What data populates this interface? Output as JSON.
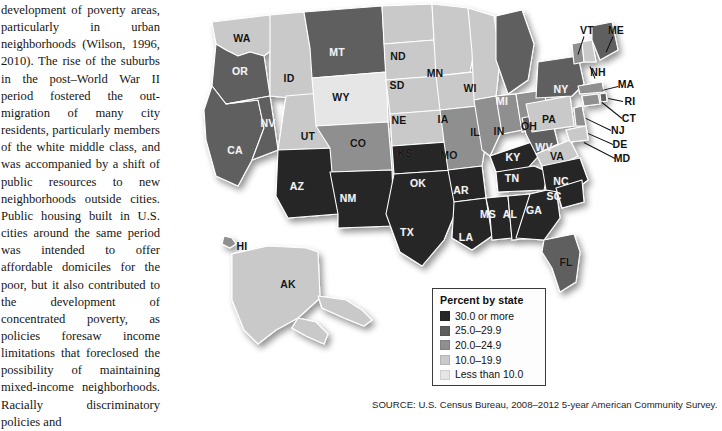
{
  "article": {
    "paragraph": "development of poverty areas, particularly in urban neighborhoods (Wilson, 1996, 2010). The rise of the suburbs in the post–World War II period fostered the out-migration of many city residents, particularly members of the white middle class, and was accompanied by a shift of public resources to new neighborhoods outside cities. Public housing built in U.S. cities around the same period was intended to offer affordable domiciles for the poor, but it also contributed to the development of concentrated poverty, as policies foresaw income limitations that foreclosed the possibility of maintaining mixed-income neighborhoods. Racially discriminatory policies and"
  },
  "figure": {
    "source": "SOURCE: U.S. Census Bureau, 2008–2012 5-year American Community Survey."
  },
  "legend": {
    "title": "Percent by state",
    "items": [
      {
        "label": "30.0 or more",
        "color": "#262626"
      },
      {
        "label": "25.0–29.9",
        "color": "#5e5e5e"
      },
      {
        "label": "20.0–24.9",
        "color": "#8f8f8f"
      },
      {
        "label": "10.0–19.9",
        "color": "#c9c9c9"
      },
      {
        "label": "Less than 10.0",
        "color": "#e6e6e6"
      }
    ]
  },
  "chart_data": {
    "type": "map",
    "title": "Percent by state",
    "subtitle": "",
    "xlabel": "",
    "ylabel": "",
    "map_type": "choropleth-us-states",
    "units": "percent",
    "bins": [
      {
        "label": "30.0 or more",
        "min": 30.0,
        "max": null,
        "color": "#262626"
      },
      {
        "label": "25.0–29.9",
        "min": 25.0,
        "max": 29.9,
        "color": "#5e5e5e"
      },
      {
        "label": "20.0–24.9",
        "min": 20.0,
        "max": 24.9,
        "color": "#8f8f8f"
      },
      {
        "label": "10.0–19.9",
        "min": 10.0,
        "max": 19.9,
        "color": "#c9c9c9"
      },
      {
        "label": "Less than 10.0",
        "min": null,
        "max": 10.0,
        "color": "#e6e6e6"
      }
    ],
    "legend_position": "bottom-left",
    "grid": false,
    "states": [
      {
        "code": "WA",
        "bin": "10.0–19.9",
        "color": "#c9c9c9",
        "x": 56,
        "y": 38,
        "tone": "light"
      },
      {
        "code": "OR",
        "bin": "25.0–29.9",
        "color": "#5e5e5e",
        "x": 54,
        "y": 71,
        "tone": "dark"
      },
      {
        "code": "CA",
        "bin": "25.0–29.9",
        "color": "#5e5e5e",
        "x": 49,
        "y": 150,
        "tone": "dark"
      },
      {
        "code": "ID",
        "bin": "10.0–19.9",
        "color": "#c9c9c9",
        "x": 103,
        "y": 78,
        "tone": "light"
      },
      {
        "code": "NV",
        "bin": "25.0–29.9",
        "color": "#5e5e5e",
        "x": 82,
        "y": 123,
        "tone": "dark"
      },
      {
        "code": "UT",
        "bin": "10.0–19.9",
        "color": "#c9c9c9",
        "x": 122,
        "y": 136,
        "tone": "light"
      },
      {
        "code": "AZ",
        "bin": "30.0 or more",
        "color": "#262626",
        "x": 111,
        "y": 186,
        "tone": "dark"
      },
      {
        "code": "MT",
        "bin": "25.0–29.9",
        "color": "#5e5e5e",
        "x": 151,
        "y": 52,
        "tone": "dark"
      },
      {
        "code": "WY",
        "bin": "Less than 10.0",
        "color": "#e6e6e6",
        "x": 155,
        "y": 97,
        "tone": "light"
      },
      {
        "code": "CO",
        "bin": "20.0–24.9",
        "color": "#8f8f8f",
        "x": 172,
        "y": 143,
        "tone": "light"
      },
      {
        "code": "NM",
        "bin": "30.0 or more",
        "color": "#262626",
        "x": 162,
        "y": 198,
        "tone": "dark"
      },
      {
        "code": "ND",
        "bin": "10.0–19.9",
        "color": "#c9c9c9",
        "x": 212,
        "y": 56,
        "tone": "light"
      },
      {
        "code": "SD",
        "bin": "10.0–19.9",
        "color": "#c9c9c9",
        "x": 211,
        "y": 85,
        "tone": "light"
      },
      {
        "code": "NE",
        "bin": "10.0–19.9",
        "color": "#c9c9c9",
        "x": 213,
        "y": 120,
        "tone": "light"
      },
      {
        "code": "KS",
        "bin": "10.0–19.9",
        "color": "#c9c9c9",
        "x": 219,
        "y": 153,
        "tone": "light"
      },
      {
        "code": "OK",
        "bin": "30.0 or more",
        "color": "#262626",
        "x": 232,
        "y": 183,
        "tone": "dark"
      },
      {
        "code": "TX",
        "bin": "30.0 or more",
        "color": "#262626",
        "x": 221,
        "y": 232,
        "tone": "dark"
      },
      {
        "code": "MN",
        "bin": "10.0–19.9",
        "color": "#c9c9c9",
        "x": 249,
        "y": 73,
        "tone": "light"
      },
      {
        "code": "IA",
        "bin": "10.0–19.9",
        "color": "#c9c9c9",
        "x": 257,
        "y": 119,
        "tone": "light"
      },
      {
        "code": "MO",
        "bin": "20.0–24.9",
        "color": "#8f8f8f",
        "x": 263,
        "y": 155,
        "tone": "light"
      },
      {
        "code": "AR",
        "bin": "30.0 or more",
        "color": "#262626",
        "x": 275,
        "y": 190,
        "tone": "dark"
      },
      {
        "code": "LA",
        "bin": "30.0 or more",
        "color": "#262626",
        "x": 280,
        "y": 237,
        "tone": "dark"
      },
      {
        "code": "WI",
        "bin": "10.0–19.9",
        "color": "#c9c9c9",
        "x": 284,
        "y": 88,
        "tone": "light"
      },
      {
        "code": "IL",
        "bin": "20.0–24.9",
        "color": "#8f8f8f",
        "x": 289,
        "y": 132,
        "tone": "light"
      },
      {
        "code": "MS",
        "bin": "30.0 or more",
        "color": "#262626",
        "x": 302,
        "y": 214,
        "tone": "dark"
      },
      {
        "code": "MI",
        "bin": "25.0–29.9",
        "color": "#5e5e5e",
        "x": 316,
        "y": 101,
        "tone": "dark"
      },
      {
        "code": "IN",
        "bin": "20.0–24.9",
        "color": "#8f8f8f",
        "x": 313,
        "y": 131,
        "tone": "light"
      },
      {
        "code": "KY",
        "bin": "30.0 or more",
        "color": "#262626",
        "x": 327,
        "y": 157,
        "tone": "dark"
      },
      {
        "code": "TN",
        "bin": "30.0 or more",
        "color": "#262626",
        "x": 326,
        "y": 178,
        "tone": "dark"
      },
      {
        "code": "AL",
        "bin": "30.0 or more",
        "color": "#262626",
        "x": 324,
        "y": 214,
        "tone": "dark"
      },
      {
        "code": "OH",
        "bin": "20.0–24.9",
        "color": "#8f8f8f",
        "x": 343,
        "y": 126,
        "tone": "light"
      },
      {
        "code": "GA",
        "bin": "30.0 or more",
        "color": "#262626",
        "x": 348,
        "y": 210,
        "tone": "dark"
      },
      {
        "code": "FL",
        "bin": "25.0–29.9",
        "color": "#5e5e5e",
        "x": 380,
        "y": 262,
        "tone": "light"
      },
      {
        "code": "WV",
        "bin": "25.0–29.9",
        "color": "#5e5e5e",
        "x": 358,
        "y": 147,
        "tone": "dark"
      },
      {
        "code": "VA",
        "bin": "10.0–19.9",
        "color": "#c9c9c9",
        "x": 371,
        "y": 156,
        "tone": "light"
      },
      {
        "code": "NC",
        "bin": "30.0 or more",
        "color": "#262626",
        "x": 375,
        "y": 181,
        "tone": "dark"
      },
      {
        "code": "SC",
        "bin": "30.0 or more",
        "color": "#262626",
        "x": 368,
        "y": 196,
        "tone": "dark"
      },
      {
        "code": "PA",
        "bin": "10.0–19.9",
        "color": "#c9c9c9",
        "x": 363,
        "y": 119,
        "tone": "light"
      },
      {
        "code": "NY",
        "bin": "25.0–29.9",
        "color": "#5e5e5e",
        "x": 375,
        "y": 89,
        "tone": "dark"
      },
      {
        "code": "VT",
        "bin": "20.0–24.9",
        "color": "#8f8f8f",
        "x": 401,
        "y": 30,
        "tone": "out"
      },
      {
        "code": "NH",
        "bin": "10.0–19.9",
        "color": "#c9c9c9",
        "x": 412,
        "y": 72,
        "tone": "out"
      },
      {
        "code": "ME",
        "bin": "25.0–29.9",
        "color": "#5e5e5e",
        "x": 430,
        "y": 30,
        "tone": "out"
      },
      {
        "code": "MA",
        "bin": "20.0–24.9",
        "color": "#8f8f8f",
        "x": 440,
        "y": 84,
        "tone": "out"
      },
      {
        "code": "RI",
        "bin": "25.0–29.9",
        "color": "#5e5e5e",
        "x": 444,
        "y": 101,
        "tone": "out"
      },
      {
        "code": "CT",
        "bin": "20.0–24.9",
        "color": "#8f8f8f",
        "x": 443,
        "y": 118,
        "tone": "out"
      },
      {
        "code": "NJ",
        "bin": "20.0–24.9",
        "color": "#8f8f8f",
        "x": 432,
        "y": 130,
        "tone": "out"
      },
      {
        "code": "DE",
        "bin": "20.0–24.9",
        "color": "#8f8f8f",
        "x": 434,
        "y": 144,
        "tone": "out"
      },
      {
        "code": "MD",
        "bin": "10.0–19.9",
        "color": "#c9c9c9",
        "x": 436,
        "y": 158,
        "tone": "out"
      },
      {
        "code": "AK",
        "bin": "10.0–19.9",
        "color": "#c9c9c9",
        "x": 102,
        "y": 284,
        "tone": "light"
      },
      {
        "code": "HI",
        "bin": "20.0–24.9",
        "color": "#8f8f8f",
        "x": 56,
        "y": 246,
        "tone": "out"
      }
    ]
  }
}
